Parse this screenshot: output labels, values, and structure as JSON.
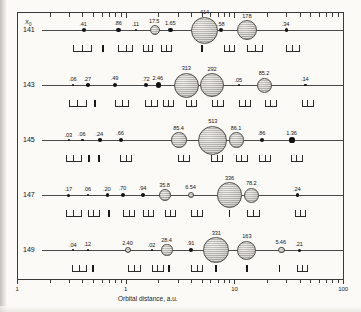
{
  "figure": {
    "corner_label": "X0",
    "axis": {
      "title": "Orbital distance, a.u.",
      "scale": "log",
      "range": [
        0.1,
        100
      ],
      "labels": [
        {
          "text": "1",
          "value": 0.1
        },
        {
          "text": "1",
          "value": 1
        },
        {
          "text": "10",
          "value": 10
        },
        {
          "text": "100",
          "value": 100
        }
      ]
    },
    "row_labels": [
      "141",
      "143",
      "145",
      "147",
      "149"
    ]
  },
  "chart_data": {
    "type": "scatter",
    "title": "",
    "xlabel": "Orbital distance, a.u.",
    "ylabel": "X0",
    "xscale": "log",
    "xlim": [
      0.1,
      100
    ],
    "legend": "none",
    "grid": false,
    "note": "Each row is a simulated planetary system. Marker size encodes body mass; the printed number is the mass value.",
    "series": [
      {
        "name": "141",
        "bodies": [
          {
            "label": ".41",
            "distance": 0.41,
            "mass": 0.41,
            "r": 2.0
          },
          {
            "label": ".86",
            "distance": 0.86,
            "mass": 0.86,
            "r": 2.2
          },
          {
            "label": ".11",
            "distance": 1.25,
            "mass": 0.11,
            "r": 1.2
          },
          {
            "label": "17.5",
            "distance": 1.85,
            "mass": 17.5,
            "r": 5.0
          },
          {
            "label": "1.65",
            "distance": 2.6,
            "mass": 1.65,
            "r": 2.4
          },
          {
            "label": "414",
            "distance": 5.3,
            "mass": 414,
            "r": 13.5
          },
          {
            "label": ".58",
            "distance": 7.6,
            "mass": 0.58,
            "r": 2.0
          },
          {
            "label": "178",
            "distance": 13.0,
            "mass": 178,
            "r": 10.0
          },
          {
            "label": ".34",
            "distance": 30.0,
            "mass": 0.34,
            "r": 1.6
          }
        ]
      },
      {
        "name": "143",
        "bodies": [
          {
            "label": ".06",
            "distance": 0.33,
            "mass": 0.06,
            "r": 1.1
          },
          {
            "label": ".27",
            "distance": 0.45,
            "mass": 0.27,
            "r": 1.7
          },
          {
            "label": ".49",
            "distance": 0.8,
            "mass": 0.49,
            "r": 2.1
          },
          {
            "label": ".72",
            "distance": 1.55,
            "mass": 0.72,
            "r": 2.0
          },
          {
            "label": "2.46",
            "distance": 2.0,
            "mass": 2.46,
            "r": 2.8
          },
          {
            "label": "313",
            "distance": 3.6,
            "mass": 313,
            "r": 12.5
          },
          {
            "label": "292",
            "distance": 6.2,
            "mass": 292,
            "r": 12.0
          },
          {
            "label": ".05",
            "distance": 11.0,
            "mass": 0.05,
            "r": 0.9
          },
          {
            "label": "85.2",
            "distance": 19.0,
            "mass": 85.2,
            "r": 7.5
          },
          {
            "label": ".14",
            "distance": 45.0,
            "mass": 0.14,
            "r": 1.3
          }
        ]
      },
      {
        "name": "145",
        "bodies": [
          {
            "label": ".03",
            "distance": 0.3,
            "mass": 0.03,
            "r": 0.9
          },
          {
            "label": ".06",
            "distance": 0.4,
            "mass": 0.06,
            "r": 1.1
          },
          {
            "label": ".24",
            "distance": 0.58,
            "mass": 0.24,
            "r": 1.7
          },
          {
            "label": ".66",
            "distance": 0.9,
            "mass": 0.66,
            "r": 2.1
          },
          {
            "label": "85.4",
            "distance": 3.1,
            "mass": 85.4,
            "r": 7.8
          },
          {
            "label": "513",
            "distance": 6.3,
            "mass": 513,
            "r": 14.5
          },
          {
            "label": "86.1",
            "distance": 10.5,
            "mass": 86.1,
            "r": 7.8
          },
          {
            "label": ".86",
            "distance": 18.0,
            "mass": 0.86,
            "r": 2.2
          },
          {
            "label": "1.36",
            "distance": 34.0,
            "mass": 1.36,
            "r": 2.6
          }
        ]
      },
      {
        "name": "147",
        "bodies": [
          {
            "label": ".17",
            "distance": 0.3,
            "mass": 0.17,
            "r": 1.5
          },
          {
            "label": ".06",
            "distance": 0.45,
            "mass": 0.06,
            "r": 1.1
          },
          {
            "label": ".20",
            "distance": 0.68,
            "mass": 0.2,
            "r": 1.6
          },
          {
            "label": ".70",
            "distance": 0.95,
            "mass": 0.7,
            "r": 2.2
          },
          {
            "label": ".94",
            "distance": 1.45,
            "mass": 0.94,
            "r": 2.3
          },
          {
            "label": "35.8",
            "distance": 2.3,
            "mass": 35.8,
            "r": 6.0
          },
          {
            "label": "6.54",
            "distance": 4.0,
            "mass": 6.54,
            "r": 3.4
          },
          {
            "label": "336",
            "distance": 9.0,
            "mass": 336,
            "r": 12.8
          },
          {
            "label": "78.2",
            "distance": 14.5,
            "mass": 78.2,
            "r": 7.5
          },
          {
            "label": ".24",
            "distance": 38.0,
            "mass": 0.24,
            "r": 1.6
          }
        ]
      },
      {
        "name": "149",
        "bodies": [
          {
            "label": ".04",
            "distance": 0.33,
            "mass": 0.04,
            "r": 1.0
          },
          {
            "label": ".12",
            "distance": 0.45,
            "mass": 0.12,
            "r": 1.4
          },
          {
            "label": "2.40",
            "distance": 1.05,
            "mass": 2.4,
            "r": 3.0
          },
          {
            "label": ".02",
            "distance": 1.75,
            "mass": 0.02,
            "r": 0.9
          },
          {
            "label": "28.4",
            "distance": 2.4,
            "mass": 28.4,
            "r": 5.6
          },
          {
            "label": ".91",
            "distance": 4.0,
            "mass": 0.91,
            "r": 2.2
          },
          {
            "label": "331",
            "distance": 6.8,
            "mass": 331,
            "r": 12.8
          },
          {
            "label": "163",
            "distance": 13.0,
            "mass": 163,
            "r": 9.5
          },
          {
            "label": "5.46",
            "distance": 27.0,
            "mass": 5.46,
            "r": 3.4
          },
          {
            "label": ".21",
            "distance": 40.0,
            "mass": 0.21,
            "r": 1.5
          }
        ]
      }
    ]
  }
}
